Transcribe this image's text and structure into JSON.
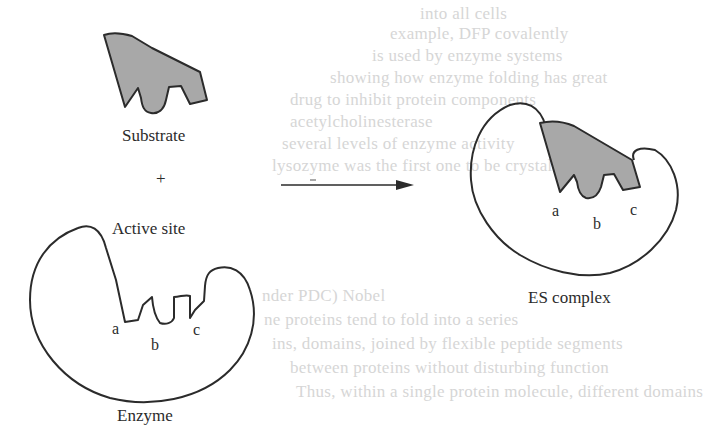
{
  "diagram": {
    "labels": {
      "substrate": "Substrate",
      "plus": "+",
      "active_site": "Active site",
      "enzyme": "Enzyme",
      "es_complex": "ES complex",
      "enzyme_site_a": "a",
      "enzyme_site_b": "b",
      "enzyme_site_c": "c",
      "complex_site_a": "a",
      "complex_site_b": "b",
      "complex_site_c": "c"
    },
    "colors": {
      "substrate_fill": "#a8a8a8",
      "outline": "#2b2b2b",
      "background": "#ffffff",
      "bleed_text": "#d6d6d6"
    },
    "nodes": [
      {
        "id": "substrate",
        "label": "Substrate"
      },
      {
        "id": "enzyme",
        "label": "Enzyme"
      },
      {
        "id": "es_complex",
        "label": "ES complex"
      }
    ],
    "edges": [
      {
        "from": "substrate+enzyme",
        "to": "es_complex",
        "type": "arrow"
      }
    ]
  },
  "bleed_through": [
    "into all cells",
    "example, DFP covalently",
    "is used by enzyme systems",
    "showing how enzyme folding has great",
    "drug to inhibit protein components",
    "acetylcholinesterase",
    "several levels of enzyme activity",
    "lysozyme was the first one to be crystallized",
    "nder PDC) Nobel",
    "ne proteins tend to fold into a series",
    "ins, domains, joined by flexible peptide segments",
    "between proteins without disturbing function",
    "Thus, within a single protein molecule, different domains"
  ]
}
